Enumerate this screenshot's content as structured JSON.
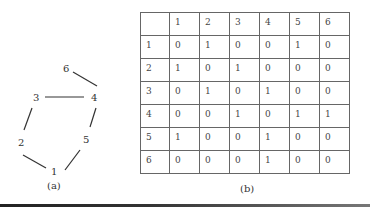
{
  "figure_a": {
    "caption": "(a)",
    "nodes": [
      {
        "id": "1",
        "label": "1",
        "x": 51,
        "y": 166
      },
      {
        "id": "2",
        "label": "2",
        "x": 18,
        "y": 139
      },
      {
        "id": "3",
        "label": "3",
        "x": 33,
        "y": 94
      },
      {
        "id": "4",
        "label": "4",
        "x": 92,
        "y": 94
      },
      {
        "id": "5",
        "label": "5",
        "x": 83,
        "y": 136
      },
      {
        "id": "6",
        "label": "6",
        "x": 63,
        "y": 65
      }
    ],
    "edges": [
      [
        "1",
        "2"
      ],
      [
        "2",
        "3"
      ],
      [
        "3",
        "4"
      ],
      [
        "4",
        "6"
      ],
      [
        "4",
        "5"
      ],
      [
        "5",
        "1"
      ]
    ]
  },
  "figure_b": {
    "caption": "(b)",
    "col_headers": [
      "",
      "1",
      "2",
      "3",
      "4",
      "5",
      "6"
    ],
    "rows": [
      {
        "label": "1",
        "values": [
          "0",
          "1",
          "0",
          "0",
          "1",
          "0"
        ]
      },
      {
        "label": "2",
        "values": [
          "1",
          "0",
          "1",
          "0",
          "0",
          "0"
        ]
      },
      {
        "label": "3",
        "values": [
          "0",
          "1",
          "0",
          "1",
          "0",
          "0"
        ]
      },
      {
        "label": "4",
        "values": [
          "0",
          "0",
          "1",
          "0",
          "1",
          "1"
        ]
      },
      {
        "label": "5",
        "values": [
          "1",
          "0",
          "0",
          "1",
          "0",
          "0"
        ]
      },
      {
        "label": "6",
        "values": [
          "0",
          "0",
          "0",
          "1",
          "0",
          "0"
        ]
      }
    ]
  }
}
